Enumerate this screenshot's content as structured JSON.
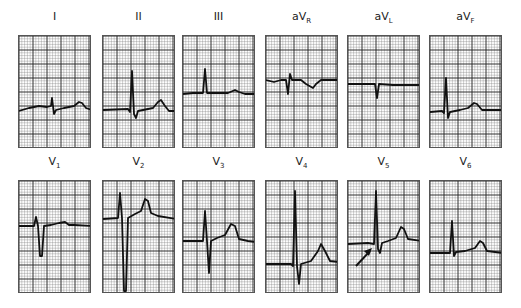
{
  "figure": {
    "rows": [
      {
        "leads": [
          {
            "id": "I",
            "label": "I",
            "sub": "",
            "path": "M0,75 L10,72 L20,70 L28,71 L32,70 L33,62 L35,78 L37,74 L45,72 L55,70 L60,66 L63,67 L67,72 L73,74"
          },
          {
            "id": "II",
            "label": "II",
            "sub": "",
            "path": "M0,74 L25,73 L27,76 L29,35 L31,78 L33,82 L35,75 L45,73 L50,72 L55,66 L58,64 L62,70 L66,75 L73,75"
          },
          {
            "id": "III",
            "label": "III",
            "sub": "",
            "path": "M0,58 L10,57 L20,57 L22,33 L24,57 L35,57 L45,57 L52,54 L56,56 L62,58 L73,58"
          }
        ]
      },
      {
        "leads": [
          {
            "id": "aVR",
            "label": "aV",
            "sub": "R",
            "path": "M0,44 L8,46 L15,44 L20,44 L22,58 L24,38 L26,44 L35,44 L40,48 L47,52 L50,48 L55,44 L73,44"
          },
          {
            "id": "aVL",
            "label": "aV",
            "sub": "L",
            "path": "M0,48 L25,48 L27,48 L29,62 L31,48 L45,49 L60,49 L73,49"
          },
          {
            "id": "aVF",
            "label": "aV",
            "sub": "F",
            "path": "M0,76 L12,75 L14,77 L16,42 L18,82 L20,76 L30,74 L38,72 L44,67 L47,68 L52,74 L73,74"
          }
        ]
      },
      {
        "leads": [
          {
            "id": "V1",
            "label": "V",
            "sub": "1",
            "path": "M0,45 L15,45 L17,36 L19,45 L21,75 L23,75 L25,45 L32,44 L40,42 L46,41 L50,44 L55,44 L73,45"
          },
          {
            "id": "V2",
            "label": "V",
            "sub": "2",
            "path": "M0,38 L15,37 L17,12 L19,37 L21,110 L23,110 L25,37 L32,33 L38,30 L42,18 L45,20 L48,32 L55,35 L73,38"
          },
          {
            "id": "V3",
            "label": "V",
            "sub": "3",
            "path": "M0,60 L20,60 L22,30 L24,60 L26,92 L28,60 L34,57 L42,54 L48,43 L52,45 L56,58 L65,60 L73,61"
          }
        ]
      },
      {
        "leads": [
          {
            "id": "V4",
            "label": "V",
            "sub": "4",
            "path": "M0,83 L25,83 L27,85 L29,10 L31,85 L33,103 L35,83 L45,80 L52,70 L55,63 L59,70 L64,80 L73,81"
          },
          {
            "id": "V5",
            "label": "V",
            "sub": "5",
            "path": "M0,63 L20,62 L26,63 L28,10 L30,68 L32,72 L34,62 L40,60 L48,57 L53,46 L56,48 L60,58 L73,60"
          },
          {
            "id": "V6",
            "label": "V",
            "sub": "6",
            "path": "M0,72 L12,72 L20,72 L22,40 L24,75 L26,71 L35,70 L45,67 L50,60 L53,62 L57,70 L73,72"
          }
        ]
      }
    ],
    "annotations": {
      "arrow_lead": "V5"
    }
  }
}
